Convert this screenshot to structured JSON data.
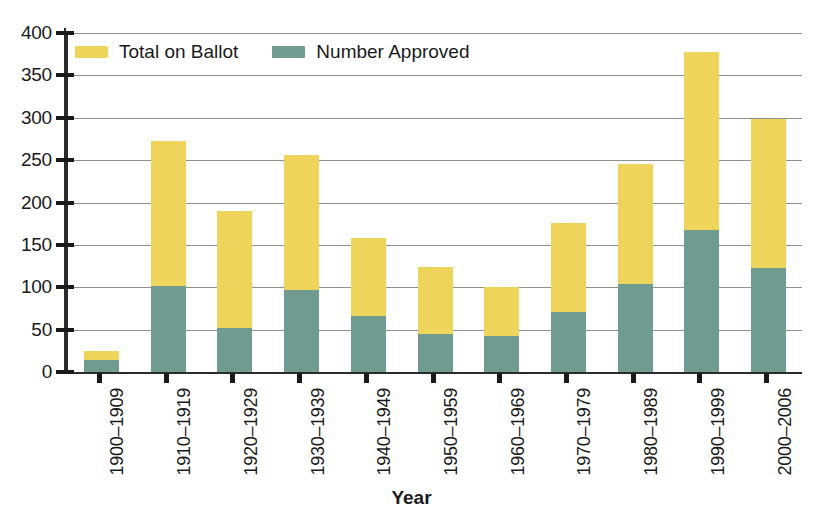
{
  "chart_data": {
    "type": "bar",
    "subtype": "stacked",
    "title": "",
    "xlabel": "Year",
    "ylabel": "",
    "ylim": [
      0,
      400
    ],
    "ytick_step": 50,
    "yticks": [
      0,
      50,
      100,
      150,
      200,
      250,
      300,
      350,
      400
    ],
    "grid": true,
    "legend_position": "top-left inside plot",
    "categories": [
      "1900–1909",
      "1910–1919",
      "1920–1929",
      "1930–1939",
      "1940–1949",
      "1950–1959",
      "1960–1969",
      "1970–1979",
      "1980–1989",
      "1990–1999",
      "2000–2006"
    ],
    "series": [
      {
        "name": "Total on Ballot",
        "color": "#efd45c",
        "values": [
          25,
          273,
          190,
          256,
          158,
          124,
          100,
          176,
          245,
          378,
          299
        ]
      },
      {
        "name": "Number Approved",
        "color": "#6f9b91",
        "values": [
          14,
          102,
          52,
          97,
          66,
          45,
          43,
          71,
          104,
          167,
          123
        ]
      }
    ]
  },
  "legend": {
    "items": [
      {
        "label": "Total on Ballot",
        "swatch": "total"
      },
      {
        "label": "Number Approved",
        "swatch": "approved"
      }
    ]
  },
  "axis": {
    "x_title": "Year"
  },
  "colors": {
    "total_on_ballot": "#efd45c",
    "number_approved": "#6f9b91",
    "axis": "#2b2b2b",
    "gridline": "#8d8f90",
    "background": "#ffffff"
  }
}
